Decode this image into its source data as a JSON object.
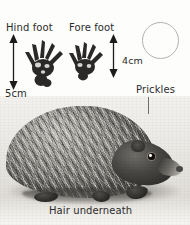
{
  "figure": {
    "background_color": "#fdfdfb",
    "text_color": "#2b2b2b"
  },
  "labels": {
    "hind_foot": "Hind foot",
    "fore_foot": "Fore foot",
    "prickles": "Prickles",
    "hair_underneath": "Hair underneath"
  },
  "measurements": [
    {
      "id": "hind-foot-length",
      "value": "5cm",
      "applies_to": "Hind foot"
    },
    {
      "id": "fore-foot-length",
      "value": "4cm",
      "applies_to": "Fore foot"
    }
  ],
  "measurement_values": {
    "hind": "5cm",
    "fore": "4cm"
  },
  "icons": {
    "footprint_hind": "hind-footprint-icon",
    "footprint_fore": "fore-footprint-icon",
    "double_arrow": "double-headed-arrow-icon",
    "circle_outline": "empty-circle-outline-icon",
    "leader_line": "leader-line-icon"
  },
  "colors": {
    "ink": "#2b2b2b",
    "arrow": "#1c1c1c",
    "circle_stroke": "#b4b2ae",
    "leader": "#6d6d6d",
    "photo_backdrop": "#e9e7e3"
  }
}
